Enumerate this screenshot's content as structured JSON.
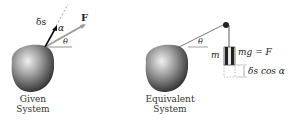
{
  "left_system": {
    "caption_line1": "Given",
    "caption_line2": "System",
    "labels": {
      "displacement": "δs",
      "alpha": "α",
      "force": "F",
      "theta": "θ"
    }
  },
  "right_system": {
    "caption_line1": "Equivalent",
    "caption_line2": "System",
    "labels": {
      "theta": "θ",
      "mass": "m",
      "weight_eq": "mg = F",
      "displacement": "δs cos α"
    }
  },
  "colors": {
    "body_dark": "#2a2a2a",
    "body_light": "#d8d8d8",
    "force_line": "#9a9a9a",
    "ink": "#1a1a1a"
  }
}
